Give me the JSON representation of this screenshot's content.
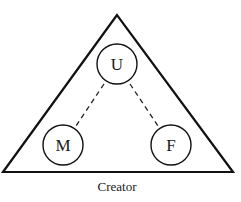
{
  "diagram": {
    "nodes": [
      {
        "id": "U",
        "label": "U"
      },
      {
        "id": "M",
        "label": "M"
      },
      {
        "id": "F",
        "label": "F"
      }
    ],
    "edges": [
      {
        "from": "U",
        "to": "M",
        "style": "dashed"
      },
      {
        "from": "U",
        "to": "F",
        "style": "dashed"
      }
    ],
    "container_label": "Creator"
  }
}
